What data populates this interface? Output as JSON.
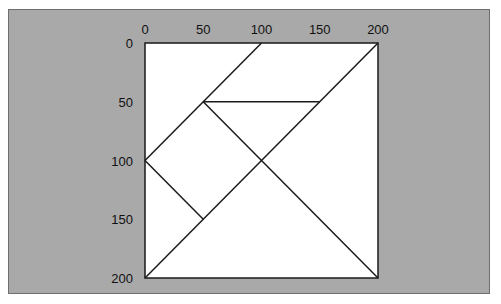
{
  "diagram": {
    "type": "tangram-grid",
    "x_ticks": [
      "0",
      "50",
      "100",
      "150",
      "200"
    ],
    "y_ticks": [
      "0",
      "50",
      "100",
      "150",
      "200"
    ],
    "x_range": [
      0,
      200
    ],
    "y_range": [
      0,
      200
    ],
    "y_axis_inverted": true,
    "background_color": "#a9a9a9",
    "square_fill": "#ffffff",
    "line_color": "#1a1a1a",
    "segments": [
      {
        "name": "diag-100-0-to-0-100",
        "from": [
          100,
          0
        ],
        "to": [
          0,
          100
        ]
      },
      {
        "name": "diag-200-0-to-0-200",
        "from": [
          200,
          0
        ],
        "to": [
          0,
          200
        ]
      },
      {
        "name": "horizontal-50",
        "from": [
          50,
          50
        ],
        "to": [
          150,
          50
        ]
      },
      {
        "name": "diag-50-50-to-200-200",
        "from": [
          50,
          50
        ],
        "to": [
          200,
          200
        ]
      },
      {
        "name": "diag-0-100-to-50-150",
        "from": [
          0,
          100
        ],
        "to": [
          50,
          150
        ]
      }
    ]
  }
}
